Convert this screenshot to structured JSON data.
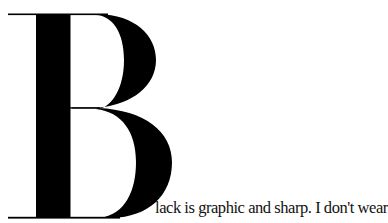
{
  "article": {
    "drop_cap": "B",
    "text_line": "lack is graphic and sharp. I don't wear"
  },
  "colors": {
    "ink": "#000000",
    "background": "#ffffff"
  }
}
